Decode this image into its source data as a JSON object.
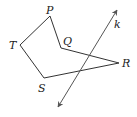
{
  "diagram": {
    "type": "geometry",
    "polygon": {
      "name": "PQRST",
      "vertices": [
        {
          "label": "P",
          "x": 50,
          "y": 16,
          "lx": 46,
          "ly": 14
        },
        {
          "label": "Q",
          "x": 61,
          "y": 48,
          "lx": 63,
          "ly": 45
        },
        {
          "label": "R",
          "x": 119,
          "y": 63,
          "lx": 122,
          "ly": 67
        },
        {
          "label": "S",
          "x": 44,
          "y": 78,
          "lx": 38,
          "ly": 92
        },
        {
          "label": "T",
          "x": 20,
          "y": 45,
          "lx": 9,
          "ly": 49
        }
      ],
      "stroke": "#333333"
    },
    "line": {
      "label": "k",
      "x1": 117,
      "y1": 10,
      "x2": 58,
      "y2": 107,
      "lx": 114,
      "ly": 28,
      "stroke": "#555555"
    }
  }
}
